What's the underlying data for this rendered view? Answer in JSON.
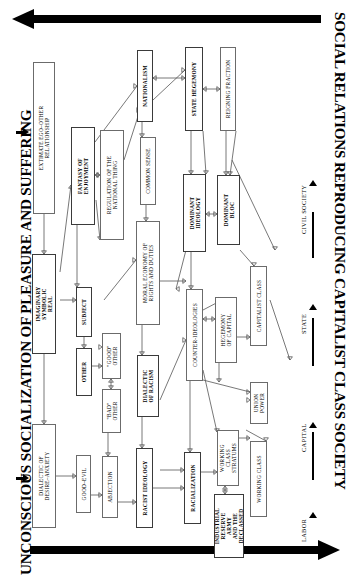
{
  "titles": {
    "left": "UNCONSCIOUS SOCIALIZATION OF PLEASURE AND SUFFERING",
    "right": "SOCIAL RELATIONS REPRODUCING CAPITALIST CLASS SOCIETY"
  },
  "axis_labels": [
    "LABOR",
    "CAPITAL",
    "STATE",
    "CIVIL SOCIETY"
  ],
  "chart_data": {
    "type": "diagram",
    "orientation": "rotated-90-ccw",
    "nodes": [
      {
        "id": "extimate",
        "label": "EXTIMATE EGO–OTHER\nRELATIONSHIP",
        "x": 33,
        "y": 62,
        "w": 22,
        "h": 152,
        "bold": false
      },
      {
        "id": "imaginary",
        "label": "IMAGINARY\nSYMBOLIC\nREAL",
        "x": 32,
        "y": 254,
        "w": 24,
        "h": 100,
        "bold": true
      },
      {
        "id": "dialdes",
        "label": "DIALECTIC OF\nDESIRE–ANXIETY",
        "x": 32,
        "y": 424,
        "w": 24,
        "h": 104,
        "bold": false
      },
      {
        "id": "fantasy",
        "label": "FANTASY OF\nENJOYMENT",
        "x": 71,
        "y": 127,
        "w": 24,
        "h": 98,
        "bold": true
      },
      {
        "id": "subject",
        "label": "SUBJECT",
        "x": 76,
        "y": 287,
        "w": 16,
        "h": 50,
        "bold": true
      },
      {
        "id": "other",
        "label": "OTHER",
        "x": 76,
        "y": 348,
        "w": 16,
        "h": 48,
        "bold": true
      },
      {
        "id": "goodevil",
        "label": "GOOD–EVIL",
        "x": 76,
        "y": 455,
        "w": 15,
        "h": 58,
        "bold": false
      },
      {
        "id": "regnat",
        "label": "REGULATION OF THE\nNATIONAL THING",
        "x": 100,
        "y": 130,
        "w": 24,
        "h": 110,
        "bold": false
      },
      {
        "id": "goodother",
        "label": "\"GOOD\"\nOTHER",
        "x": 102,
        "y": 333,
        "w": 19,
        "h": 46,
        "bold": false
      },
      {
        "id": "badother",
        "label": "\"BAD\"\nOTHER",
        "x": 102,
        "y": 389,
        "w": 19,
        "h": 44,
        "bold": false
      },
      {
        "id": "abjection",
        "label": "ABJECTION",
        "x": 102,
        "y": 456,
        "w": 16,
        "h": 62,
        "bold": false
      },
      {
        "id": "nationalism",
        "label": "NATIONALISM",
        "x": 137,
        "y": 50,
        "w": 16,
        "h": 72,
        "bold": true
      },
      {
        "id": "common",
        "label": "COMMON SENSE",
        "x": 140,
        "y": 137,
        "w": 16,
        "h": 68,
        "bold": false
      },
      {
        "id": "moral",
        "label": "MORAL ECONOMY OF\nRIGHTS AND DUTIES",
        "x": 136,
        "y": 221,
        "w": 24,
        "h": 104,
        "bold": false
      },
      {
        "id": "dialrac",
        "label": "DIALECTIC\nOF RACISM",
        "x": 137,
        "y": 355,
        "w": 22,
        "h": 62,
        "bold": true
      },
      {
        "id": "racist",
        "label": "RACIST IDEOLOGY",
        "x": 136,
        "y": 448,
        "w": 17,
        "h": 80,
        "bold": true
      },
      {
        "id": "statehege",
        "label": "STATE HEGEMONY",
        "x": 185,
        "y": 47,
        "w": 18,
        "h": 84,
        "bold": true
      },
      {
        "id": "domideo",
        "label": "DOMINANT\nIDEOLOGY",
        "x": 183,
        "y": 174,
        "w": 23,
        "h": 78,
        "bold": true
      },
      {
        "id": "counter",
        "label": "COUNTER-IDEOLOGIES",
        "x": 186,
        "y": 289,
        "w": 17,
        "h": 92,
        "bold": false
      },
      {
        "id": "racializ",
        "label": "RACIALIZATION",
        "x": 184,
        "y": 452,
        "w": 17,
        "h": 72,
        "bold": true
      },
      {
        "id": "reigning",
        "label": "REIGNING FRACTION",
        "x": 220,
        "y": 47,
        "w": 16,
        "h": 84,
        "bold": false
      },
      {
        "id": "domibloc",
        "label": "DOMINANT\nBLOC",
        "x": 217,
        "y": 175,
        "w": 23,
        "h": 70,
        "bold": true
      },
      {
        "id": "hegecap",
        "label": "HEGEMONY\nOF CAPITAL",
        "x": 215,
        "y": 297,
        "w": 22,
        "h": 66,
        "bold": false
      },
      {
        "id": "workstrat",
        "label": "WORKING\nCLASS\nSTRATUMS",
        "x": 217,
        "y": 430,
        "w": 22,
        "h": 56,
        "bold": false
      },
      {
        "id": "industrial",
        "label": "INDUSTRIAL\nRESERVE\nARMY\nAND THE\nDECLASSED",
        "x": 214,
        "y": 494,
        "w": 30,
        "h": 64,
        "bold": true
      },
      {
        "id": "capclass",
        "label": "CAPITALIST CLASS",
        "x": 250,
        "y": 266,
        "w": 17,
        "h": 80,
        "bold": false
      },
      {
        "id": "unionpow",
        "label": "UNION\nPOWER",
        "x": 250,
        "y": 382,
        "w": 18,
        "h": 42,
        "bold": false
      },
      {
        "id": "workclass",
        "label": "WORKING CLASS",
        "x": 250,
        "y": 441,
        "w": 17,
        "h": 76,
        "bold": false
      }
    ],
    "band_arrows": [
      {
        "id": "top-band",
        "direction": "left",
        "label": ""
      },
      {
        "id": "bottom-band",
        "direction": "right",
        "label": ""
      }
    ]
  }
}
